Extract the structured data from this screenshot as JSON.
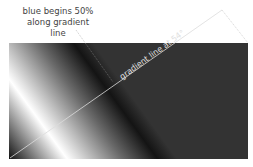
{
  "annotation": {
    "line1": "blue  begins 50%",
    "line2": "along gradient line"
  },
  "gradient_line_label": "gradient line at 54°",
  "colors": {
    "background": "#ffffff",
    "gradient_start": "#111111",
    "gradient_light": "#ffffff",
    "gradient_end": "#333333",
    "line": "#dddddd",
    "text": "#444444"
  }
}
